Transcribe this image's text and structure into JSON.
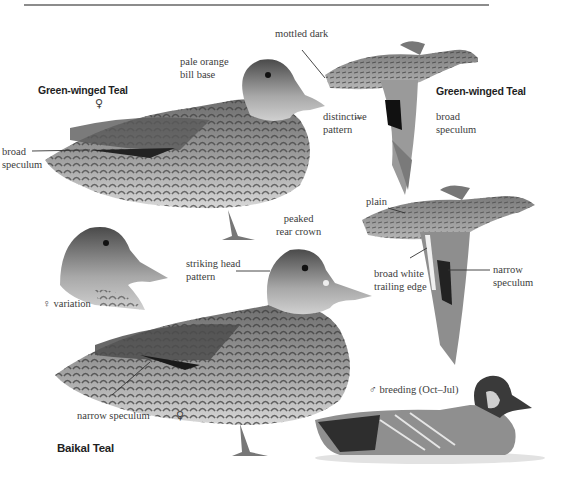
{
  "species": {
    "green_winged_teal": {
      "title_left": "Green-winged Teal",
      "title_flight": "Green-winged Teal",
      "sex_symbol": "♀"
    },
    "baikal_teal": {
      "title": "Baikal Teal",
      "sex_symbol": "♀"
    }
  },
  "labels": {
    "mottled_dark": "mottled dark",
    "pale_orange_bill_base": "pale orange\nbill base",
    "broad_speculum_left": "broad\nspeculum",
    "distinctive_pattern": "distinctive\npattern",
    "broad_speculum_flight": "broad\nspeculum",
    "plain": "plain",
    "peaked_rear_crown": "peaked\nrear crown",
    "striking_head_pattern": "striking head\npattern",
    "broad_white_trailing_edge": "broad white\ntrailing edge",
    "narrow_speculum_flight": "narrow\nspeculum",
    "female_variation": "♀ variation",
    "narrow_speculum_standing": "narrow speculum",
    "male_breeding": "♂ breeding (Oct–Jul)"
  },
  "colors": {
    "rule": "#8c8c8c",
    "text": "#3c3c3c",
    "title": "#1f1f1f",
    "plumage_dark": "#3a3a3a",
    "plumage_mid": "#8a8a8a",
    "plumage_light": "#cfcfcf"
  }
}
